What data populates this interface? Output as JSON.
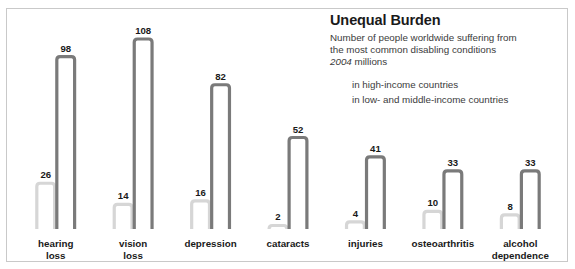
{
  "header": {
    "title": "Unequal Burden",
    "subtitle_line1": "Number of people worldwide suffering from",
    "subtitle_line2": "the most common disabling conditions",
    "subtitle_year": "2004",
    "subtitle_units": " millions"
  },
  "legend": {
    "items": [
      {
        "label": "in high-income countries",
        "color": "#d6d6d6"
      },
      {
        "label": "in low- and middle-income countries",
        "color": "#7a7a7a"
      }
    ]
  },
  "colors": {
    "high_income": "#d6d6d6",
    "low_middle_income": "#7a7a7a",
    "frame": "#c9c9c9",
    "text": "#1a1a1a"
  },
  "chart_data": {
    "type": "bar",
    "title": "Unequal Burden",
    "subtitle": "Number of people worldwide suffering from the most common disabling conditions, 2004 millions",
    "xlabel": "",
    "ylabel": "millions of people",
    "ylim": [
      0,
      112
    ],
    "grid": false,
    "legend_position": "top-right",
    "categories": [
      "hearing loss",
      "vision loss",
      "depression",
      "cataracts",
      "injuries",
      "osteoarthritis",
      "alcohol dependence"
    ],
    "category_lines": [
      [
        "hearing",
        "loss"
      ],
      [
        "vision",
        "loss"
      ],
      [
        "depression"
      ],
      [
        "cataracts"
      ],
      [
        "injuries"
      ],
      [
        "osteoarthritis"
      ],
      [
        "alcohol",
        "dependence"
      ]
    ],
    "series": [
      {
        "name": "in high-income countries",
        "color": "#d6d6d6",
        "values": [
          26,
          14,
          16,
          2,
          4,
          10,
          8
        ]
      },
      {
        "name": "in low- and middle-income countries",
        "color": "#7a7a7a",
        "values": [
          98,
          108,
          82,
          52,
          41,
          33,
          33
        ]
      }
    ]
  }
}
